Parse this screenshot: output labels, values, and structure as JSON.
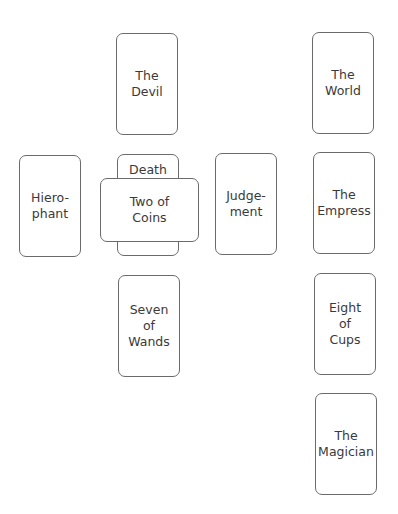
{
  "spread": {
    "cards": [
      {
        "id": "the-devil",
        "label": "The\nDevil",
        "x": 116,
        "y": 33,
        "w": 62,
        "h": 102,
        "orientation": "upright"
      },
      {
        "id": "hierophant",
        "label": "Hiero-\nphant",
        "x": 19,
        "y": 155,
        "w": 62,
        "h": 102,
        "orientation": "upright"
      },
      {
        "id": "death",
        "label": "Death",
        "x": 117,
        "y": 154,
        "w": 62,
        "h": 102,
        "orientation": "upright"
      },
      {
        "id": "two-of-coins",
        "label": "Two of\nCoins",
        "x": 100,
        "y": 178,
        "w": 99,
        "h": 64,
        "orientation": "crossing"
      },
      {
        "id": "judgement",
        "label": "Judge-\nment",
        "x": 215,
        "y": 153,
        "w": 62,
        "h": 102,
        "orientation": "upright"
      },
      {
        "id": "the-world",
        "label": "The\nWorld",
        "x": 312,
        "y": 32,
        "w": 62,
        "h": 102,
        "orientation": "upright"
      },
      {
        "id": "the-empress",
        "label": "The\nEmpress",
        "x": 313,
        "y": 152,
        "w": 62,
        "h": 102,
        "orientation": "upright"
      },
      {
        "id": "seven-of-wands",
        "label": "Seven\nof\nWands",
        "x": 118,
        "y": 275,
        "w": 62,
        "h": 102,
        "orientation": "upright"
      },
      {
        "id": "eight-of-cups",
        "label": "Eight\nof\nCups",
        "x": 314,
        "y": 273,
        "w": 62,
        "h": 102,
        "orientation": "upright"
      },
      {
        "id": "the-magician",
        "label": "The\nMagician",
        "x": 315,
        "y": 393,
        "w": 62,
        "h": 102,
        "orientation": "upright"
      }
    ]
  },
  "colors": {
    "border": "#6b6b6b",
    "text": "#3a3a3a",
    "background": "#ffffff"
  }
}
